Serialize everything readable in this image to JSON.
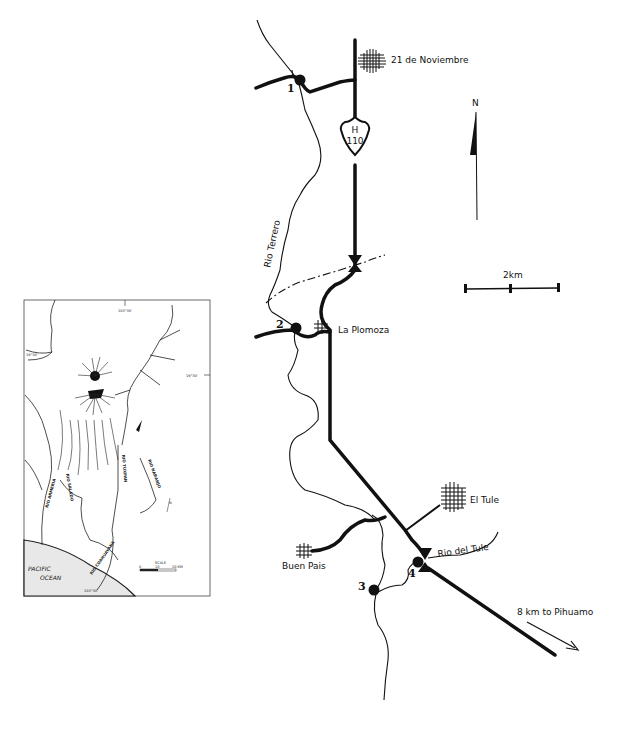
{
  "main_map": {
    "localities": [
      {
        "name": "21 de Noviembre"
      },
      {
        "name": "La Plomoza"
      },
      {
        "name": "El Tule"
      },
      {
        "name": "Buen Pais"
      }
    ],
    "sites": [
      {
        "number": "1"
      },
      {
        "number": "2"
      },
      {
        "number": "3"
      },
      {
        "number": "4"
      }
    ],
    "rivers": [
      {
        "name": "Rio Terrero"
      },
      {
        "name": "Rio del Tule"
      }
    ],
    "highway_shield": {
      "letter": "H",
      "number": "110"
    },
    "north_label": "N",
    "scale_label": "2km",
    "direction_note": "8 km to Pihuamo",
    "colors": {
      "ink": "#111111",
      "background": "#ffffff"
    }
  },
  "inset_map": {
    "ocean_label_line1": "PACIFIC",
    "ocean_label_line2": "OCEAN",
    "scale_title": "SCALE",
    "scale_ticks": [
      "0",
      "10",
      "20 KM"
    ],
    "coord_top": "103°30'",
    "coord_left": "19°30'",
    "coord_right": "19°30'",
    "coord_bottom": "103°30'",
    "north_label": "N",
    "river_labels": [
      "RIO ARMERIA",
      "RIO SALADO",
      "RIO TUXPAN",
      "RIO COAHUAYANA",
      "RIO NARANJO"
    ]
  }
}
